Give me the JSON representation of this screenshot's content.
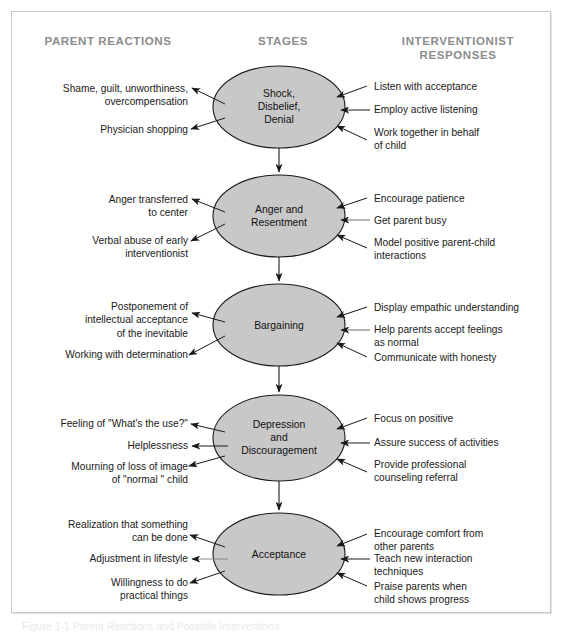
{
  "figure": {
    "caption": "Figure 1-1   Parent Reactions and Possible Interventions",
    "background": "#ffffff",
    "frame_border_color": "#c9c9c9",
    "ellipse_fill": "#c8c8c8",
    "ellipse_stroke": "#1a1a1a",
    "heading_color": "#8c8c8c",
    "text_color": "#1a1a1a"
  },
  "headings": {
    "left": "PARENT REACTIONS",
    "center": "STAGES",
    "right": "INTERVENTIONIST\nRESPONSES"
  },
  "stages": [
    {
      "id": "shock",
      "label": "Shock,\nDisbelief,\nDenial",
      "parent_reactions": [
        "Shame, guilt, unworthiness,\novercompensation",
        "Physician shopping"
      ],
      "interventionist_responses": [
        "Listen with acceptance",
        "Employ active listening",
        "Work together in behalf\nof child"
      ]
    },
    {
      "id": "anger",
      "label": "Anger and\nResentment",
      "parent_reactions": [
        "Anger transferred\nto center",
        "Verbal abuse of early\ninterventionist"
      ],
      "interventionist_responses": [
        "Encourage patience",
        "Get parent busy",
        "Model positive parent-child\ninteractions"
      ]
    },
    {
      "id": "bargaining",
      "label": "Bargaining",
      "parent_reactions": [
        "Postponement of\nintellectual acceptance\nof the inevitable",
        "Working with determination"
      ],
      "interventionist_responses": [
        "Display empathic understanding",
        "Help parents accept feelings\nas normal",
        "Communicate with honesty"
      ]
    },
    {
      "id": "depression",
      "label": "Depression\nand\nDiscouragement",
      "parent_reactions": [
        "Feeling of \"What's the use?\"",
        "Helplessness",
        "Mourning of loss of image\nof \"normal \" child"
      ],
      "interventionist_responses": [
        "Focus on positive",
        "Assure success of activities",
        "Provide professional\ncounseling referral"
      ]
    },
    {
      "id": "acceptance",
      "label": "Acceptance",
      "parent_reactions": [
        "Realization that something\ncan be done",
        "Adjustment in lifestyle",
        "Willingness to do\npractical things"
      ],
      "interventionist_responses": [
        "Encourage comfort from\nother parents",
        "Teach new interaction\ntechniques",
        "Praise parents when\nchild shows progress"
      ]
    }
  ]
}
